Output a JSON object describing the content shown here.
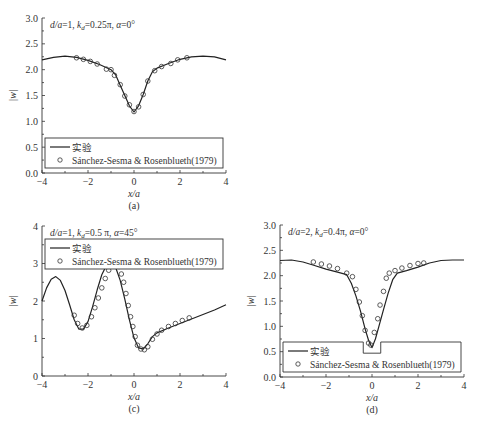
{
  "figure": {
    "panels": [
      "a",
      "b",
      "c",
      "d"
    ]
  },
  "chart_data": [
    {
      "id": "a",
      "type": "line",
      "caption": "(a)",
      "annotation": "d/a=1, k_d=0.25π, α=0°",
      "annotation_parts": {
        "d": "d/a",
        "eq1": "=1, ",
        "k": "k",
        "sub": "d",
        "eq2": "=0.25π, ",
        "alpha": "α",
        "eq3": "=0°"
      },
      "xlabel": "x/a",
      "ylabel": "|w|",
      "xlim": [
        -4,
        4
      ],
      "ylim": [
        0,
        3
      ],
      "xticks": [
        -4,
        -2,
        0,
        2,
        4
      ],
      "xtick_labels": [
        "−4",
        "−2",
        "0",
        "2",
        "4"
      ],
      "yticks": [
        0,
        0.5,
        1.0,
        1.5,
        2.0,
        2.5,
        3.0
      ],
      "ytick_labels": [
        "0.0",
        "0.5",
        "1.0",
        "1.5",
        "2.0",
        "2.5",
        "3.0"
      ],
      "legend": {
        "position": "lower",
        "entries": [
          "实验",
          "Sánchez-Sesma & Rosenblueth(1979)"
        ]
      },
      "series": [
        {
          "name": "实验",
          "style": "line",
          "x": [
            -4,
            -3.5,
            -3,
            -2.5,
            -2,
            -1.5,
            -1,
            -0.8,
            -0.6,
            -0.4,
            -0.2,
            0,
            0.2,
            0.4,
            0.6,
            0.8,
            1,
            1.5,
            2,
            2.5,
            3,
            3.5,
            4
          ],
          "y": [
            2.19,
            2.24,
            2.26,
            2.24,
            2.18,
            2.1,
            2.0,
            1.9,
            1.7,
            1.5,
            1.3,
            1.18,
            1.3,
            1.52,
            1.78,
            1.96,
            2.03,
            2.12,
            2.2,
            2.25,
            2.26,
            2.25,
            2.19
          ]
        },
        {
          "name": "Sánchez-Sesma & Rosenblueth(1979)",
          "style": "circle",
          "x": [
            -2.5,
            -2.2,
            -1.9,
            -1.6,
            -1.2,
            -1.0,
            -0.85,
            -0.6,
            -0.4,
            -0.2,
            0,
            0.2,
            0.4,
            0.6,
            0.9,
            1.2,
            1.6,
            1.9,
            2.3
          ],
          "y": [
            2.23,
            2.2,
            2.16,
            2.11,
            2.01,
            2.0,
            1.89,
            1.71,
            1.49,
            1.32,
            1.19,
            1.28,
            1.52,
            1.78,
            1.98,
            2.06,
            2.12,
            2.19,
            2.23
          ]
        }
      ]
    },
    {
      "id": "b",
      "type": "line",
      "caption": "(b)",
      "annotation": "d/a=1, k_d=0.5π, α=0°",
      "annotation_parts": {
        "d": "d/a",
        "eq1": "=1, ",
        "k": "k",
        "sub": "d",
        "eq2": "=0.5π, ",
        "alpha": "α",
        "eq3": "=0°"
      },
      "xlabel": "x/a",
      "ylabel": "|w|",
      "xlim": [
        -4,
        4
      ],
      "ylim": [
        0,
        3
      ],
      "xticks": [
        -4,
        -2,
        0,
        2,
        4
      ],
      "xtick_labels": [
        "−4",
        "−2",
        "0",
        "2",
        "4"
      ],
      "yticks": [
        0,
        0.5,
        1.0,
        1.5,
        2.0,
        2.5,
        3.0
      ],
      "ytick_labels": [
        "0.0",
        "0.5",
        "1.0",
        "1.5",
        "2.0",
        "2.5",
        "3.0"
      ],
      "legend": {
        "position": "lower",
        "entries": [
          "实验",
          "Sánchez-Sesma & Rosenblueth(1979)"
        ]
      },
      "series": [
        {
          "name": "实验",
          "style": "line",
          "x": [
            -4,
            -3.7,
            -3.4,
            -3.0,
            -2.6,
            -2.2,
            -1.9,
            -1.6,
            -1.3,
            -1.0,
            -0.8,
            -0.6,
            -0.45,
            -0.3,
            -0.15,
            0,
            0.15,
            0.3,
            0.45,
            0.6,
            0.8,
            1.0,
            1.3,
            1.6,
            1.9,
            2.2,
            2.6,
            3.0,
            3.4,
            3.7,
            4
          ],
          "y": [
            1.5,
            1.5,
            1.65,
            1.95,
            2.3,
            2.58,
            2.66,
            2.67,
            2.6,
            2.35,
            1.95,
            1.45,
            1.1,
            0.98,
            0.98,
            1.02,
            0.98,
            0.98,
            1.1,
            1.45,
            1.95,
            2.38,
            2.62,
            2.67,
            2.66,
            2.56,
            2.25,
            1.9,
            1.6,
            1.48,
            1.53
          ]
        },
        {
          "name": "Sánchez-Sesma & Rosenblueth(1979)",
          "style": "circle",
          "x": [
            -2.45,
            -2.2,
            -2.0,
            -1.75,
            -1.45,
            -1.1,
            -0.9,
            -0.75,
            -0.65,
            -0.55,
            -0.45,
            -0.35,
            -0.2,
            -0.05,
            0.1,
            0.25,
            0.4,
            0.5,
            0.6,
            0.7,
            0.8,
            0.9,
            1.1,
            1.4,
            1.6,
            1.9,
            2.2,
            2.45
          ],
          "y": [
            2.35,
            2.5,
            2.62,
            2.67,
            2.65,
            2.53,
            2.4,
            2.2,
            1.96,
            1.7,
            1.42,
            1.22,
            0.99,
            1.0,
            1.02,
            1.01,
            1.25,
            1.52,
            1.78,
            2.06,
            2.32,
            2.5,
            2.58,
            2.66,
            2.67,
            2.67,
            2.54,
            2.38
          ]
        }
      ]
    },
    {
      "id": "c",
      "type": "line",
      "caption": "(c)",
      "annotation": "d/a=1, k_d=0.5 π, α=45°",
      "annotation_parts": {
        "d": "d/a",
        "eq1": "=1, ",
        "k": "k",
        "sub": "d",
        "eq2": "=0.5 π, ",
        "alpha": "α",
        "eq3": "=45°"
      },
      "xlabel": "x/a",
      "ylabel": "|w|",
      "xlim": [
        -4,
        4
      ],
      "ylim": [
        0,
        4
      ],
      "xticks": [
        -4,
        -2,
        0,
        2,
        4
      ],
      "xtick_labels": [
        "−4",
        "−2",
        "0",
        "2",
        "4"
      ],
      "yticks": [
        0,
        1,
        2,
        3,
        4
      ],
      "ytick_labels": [
        "0",
        "1",
        "2",
        "3",
        "4"
      ],
      "legend": {
        "position": "upper",
        "entries": [
          "实验",
          "Sánchez-Sesma & Rosenblueth(1979)"
        ]
      },
      "series": [
        {
          "name": "实验",
          "style": "line",
          "x": [
            -4,
            -3.8,
            -3.6,
            -3.4,
            -3.2,
            -3.0,
            -2.8,
            -2.6,
            -2.4,
            -2.2,
            -2.0,
            -1.8,
            -1.6,
            -1.4,
            -1.2,
            -1.0,
            -0.8,
            -0.6,
            -0.4,
            -0.2,
            0,
            0.2,
            0.4,
            0.6,
            0.8,
            1.0,
            1.5,
            2.0,
            2.5,
            3.0,
            3.5,
            4
          ],
          "y": [
            2.0,
            2.35,
            2.58,
            2.65,
            2.55,
            2.28,
            1.9,
            1.5,
            1.25,
            1.25,
            1.45,
            1.85,
            2.3,
            2.7,
            2.95,
            3.0,
            2.9,
            2.55,
            2.05,
            1.5,
            1.02,
            0.75,
            0.72,
            0.86,
            1.05,
            1.15,
            1.28,
            1.4,
            1.52,
            1.64,
            1.76,
            1.9
          ]
        },
        {
          "name": "Sánchez-Sesma & Rosenblueth(1979)",
          "style": "circle",
          "x": [
            -2.6,
            -2.45,
            -2.25,
            -2.05,
            -1.85,
            -1.7,
            -1.55,
            -1.4,
            -1.25,
            -1.1,
            -0.95,
            -0.8,
            -0.65,
            -0.55,
            -0.45,
            -0.35,
            -0.25,
            -0.15,
            -0.05,
            0.05,
            0.15,
            0.3,
            0.45,
            0.6,
            0.8,
            1.0,
            1.2,
            1.5,
            1.8,
            2.1,
            2.4
          ],
          "y": [
            1.62,
            1.4,
            1.28,
            1.35,
            1.58,
            1.82,
            2.08,
            2.35,
            2.6,
            2.82,
            2.98,
            2.98,
            2.92,
            2.72,
            2.5,
            2.2,
            1.88,
            1.58,
            1.32,
            1.05,
            0.82,
            0.72,
            0.7,
            0.78,
            0.98,
            1.12,
            1.22,
            1.32,
            1.4,
            1.48,
            1.55
          ]
        }
      ]
    },
    {
      "id": "d",
      "type": "line",
      "caption": "(d)",
      "annotation": "d/a=2, k_d=0.4π, α=0°",
      "annotation_parts": {
        "d": "d/a",
        "eq1": "=2, ",
        "k": "k",
        "sub": "d",
        "eq2": "=0.4π, ",
        "alpha": "α",
        "eq3": "=0°"
      },
      "xlabel": "x/a",
      "ylabel": "|w|",
      "xlim": [
        -4,
        4
      ],
      "ylim": [
        0,
        3
      ],
      "xticks": [
        -4,
        -2,
        0,
        2,
        4
      ],
      "xtick_labels": [
        "−4",
        "−2",
        "0",
        "2",
        "4"
      ],
      "yticks": [
        0,
        0.5,
        1.0,
        1.5,
        2.0,
        2.5,
        3.0
      ],
      "ytick_labels": [
        "0.0",
        "0.5",
        "1.0",
        "1.5",
        "2.0",
        "2.5",
        "3.0"
      ],
      "legend": {
        "position": "lower",
        "entries": [
          "实验",
          "Sánchez-Sesma & Rosenblueth(1979)"
        ]
      },
      "series": [
        {
          "name": "实验",
          "style": "line",
          "x": [
            -4,
            -3.5,
            -3.0,
            -2.5,
            -2.0,
            -1.5,
            -1.1,
            -0.9,
            -0.7,
            -0.5,
            -0.3,
            -0.15,
            0,
            0.15,
            0.3,
            0.5,
            0.7,
            0.9,
            1.1,
            1.5,
            2.0,
            2.5,
            3.0,
            3.5,
            4
          ],
          "y": [
            2.3,
            2.31,
            2.27,
            2.2,
            2.13,
            2.07,
            2.02,
            1.85,
            1.6,
            1.3,
            0.95,
            0.72,
            0.58,
            0.75,
            1.0,
            1.33,
            1.65,
            1.92,
            2.05,
            2.1,
            2.17,
            2.25,
            2.3,
            2.31,
            2.31
          ]
        },
        {
          "name": "Sánchez-Sesma & Rosenblueth(1979)",
          "style": "circle",
          "x": [
            -2.55,
            -2.2,
            -1.85,
            -1.5,
            -1.1,
            -0.85,
            -0.7,
            -0.55,
            -0.42,
            -0.3,
            -0.15,
            -0.05,
            0.1,
            0.25,
            0.35,
            0.5,
            0.62,
            0.75,
            1.0,
            1.3,
            1.65,
            2.0,
            2.25
          ],
          "y": [
            2.27,
            2.23,
            2.19,
            2.14,
            2.05,
            1.98,
            1.73,
            1.48,
            1.21,
            0.92,
            0.67,
            0.63,
            0.88,
            1.15,
            1.42,
            1.69,
            1.95,
            2.05,
            2.1,
            2.15,
            2.2,
            2.24,
            2.25
          ]
        }
      ]
    }
  ]
}
